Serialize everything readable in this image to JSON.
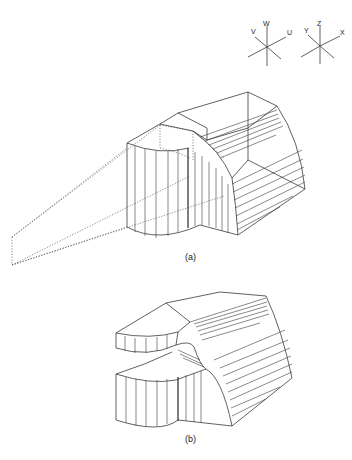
{
  "figure": {
    "panels": [
      {
        "id": "a",
        "label": "(a)",
        "description": "Isometric wireframe of swept solid with dotted projection lines to a point at left"
      },
      {
        "id": "b",
        "label": "(b)",
        "description": "Isometric wireframe of solid split into upper and lower parts"
      }
    ],
    "axes_triads": [
      {
        "name": "uvw-triad",
        "labels": [
          "V",
          "W",
          "U"
        ]
      },
      {
        "name": "xyz-triad",
        "labels": [
          "Y",
          "Z",
          "X"
        ]
      }
    ],
    "colors": {
      "line": "#3a3a3a",
      "background": "#ffffff"
    }
  }
}
